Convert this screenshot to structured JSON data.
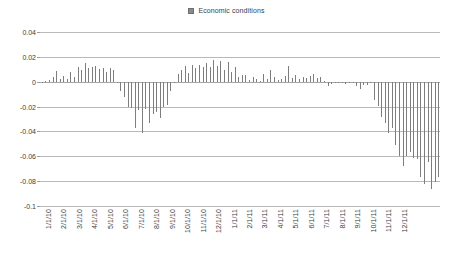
{
  "legend": {
    "position": "top-center",
    "entries": [
      {
        "label": "Economic conditions",
        "color": "#7d7d7d",
        "marker": "square-swatch"
      }
    ]
  },
  "axes": {
    "y_ticks": [
      "0.04",
      "0.02",
      "0",
      "-0.02",
      "-0.04",
      "-0.06",
      "-0.08",
      "-0.1"
    ],
    "x_ticks": [
      "1/1/10",
      "2/1/10",
      "3/1/10",
      "4/1/10",
      "5/1/10",
      "6/1/10",
      "7/1/10",
      "8/1/10",
      "9/1/10",
      "10/1/10",
      "11/1/10",
      "12/1/10",
      "1/1/11",
      "2/1/11",
      "3/1/11",
      "4/1/11",
      "5/1/11",
      "6/1/11",
      "7/1/11",
      "8/1/11",
      "9/1/11",
      "10/1/11",
      "11/1/11",
      "12/1/11"
    ]
  },
  "chart_data": {
    "type": "bar",
    "title": "",
    "subtitle": "",
    "xlabel": "",
    "ylabel": "",
    "ylim": [
      -0.1,
      0.04
    ],
    "ytick_step": 0.02,
    "grid": true,
    "legend_position": "top-center",
    "bar_color": "#7d7d7d",
    "series_name": "Economic conditions",
    "x_tick_labels": [
      "1/1/10",
      "2/1/10",
      "3/1/10",
      "4/1/10",
      "5/1/10",
      "6/1/10",
      "7/1/10",
      "8/1/10",
      "9/1/10",
      "10/1/10",
      "11/1/10",
      "12/1/10",
      "1/1/11",
      "2/1/11",
      "3/1/11",
      "4/1/11",
      "5/1/11",
      "6/1/11",
      "7/1/11",
      "8/1/11",
      "9/1/11",
      "10/1/11",
      "11/1/11",
      "12/1/11"
    ],
    "x_tick_positions": [
      0,
      4.33,
      8.67,
      13,
      17.33,
      21.67,
      26,
      30.33,
      34.67,
      39,
      43.33,
      47.67,
      52,
      56.33,
      60.67,
      65,
      69.33,
      73.67,
      78,
      82.33,
      86.67,
      91,
      95.33,
      99.67
    ],
    "n_points": 104,
    "frequency": "weekly",
    "values": [
      -0.0005,
      0.0008,
      0.0012,
      0.0035,
      0.0088,
      0.002,
      0.0045,
      0.0022,
      0.008,
      0.0038,
      0.012,
      0.0095,
      0.0148,
      0.0112,
      0.0118,
      0.0125,
      0.0105,
      0.011,
      0.0075,
      0.0108,
      0.0098,
      0.0,
      -0.0075,
      -0.012,
      -0.02,
      -0.0212,
      -0.0375,
      -0.0228,
      -0.0412,
      -0.0222,
      -0.033,
      -0.0262,
      -0.0245,
      -0.029,
      -0.02,
      -0.0185,
      -0.0075,
      0.0,
      0.006,
      0.0098,
      0.0128,
      0.007,
      0.0135,
      0.0112,
      0.0138,
      0.0122,
      0.0148,
      0.0118,
      0.0172,
      0.013,
      0.0168,
      0.0098,
      0.0155,
      0.0082,
      0.0115,
      0.0035,
      0.0052,
      0.0058,
      0.0012,
      0.004,
      0.0025,
      0.0005,
      0.0062,
      0.0022,
      0.0095,
      0.0038,
      0.001,
      0.0018,
      0.0045,
      0.0128,
      0.003,
      0.0052,
      0.0022,
      0.0038,
      0.003,
      0.0048,
      0.0062,
      0.0028,
      0.004,
      0.0008,
      -0.0035,
      -0.0015,
      -0.0008,
      -0.0012,
      -0.0005,
      -0.002,
      -0.001,
      -0.0002,
      -0.0035,
      -0.006,
      -0.0025,
      -0.003,
      -0.0012,
      -0.015,
      -0.0195,
      -0.0285,
      -0.033,
      -0.041,
      -0.037,
      -0.051,
      -0.06,
      -0.068,
      -0.06,
      -0.0565,
      -0.061,
      -0.0625,
      -0.077,
      -0.082,
      -0.0645,
      -0.0865,
      -0.081,
      -0.077
    ]
  }
}
